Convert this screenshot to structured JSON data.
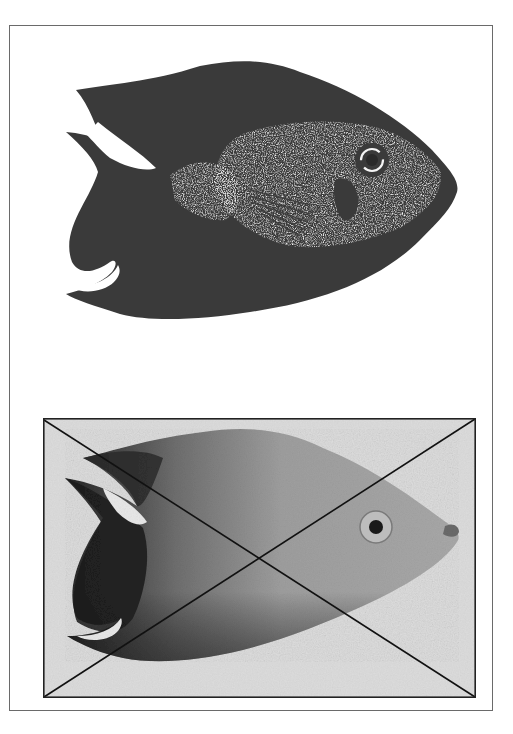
{
  "page": {
    "width": 513,
    "height": 734,
    "background": "#ffffff"
  },
  "frame": {
    "border_color": "#6a6a6a"
  },
  "figures": [
    {
      "id": "top",
      "description": "High-contrast black-and-white drawing of a fish facing right (dark silhouette with speckled white face and pectoral fin area)",
      "style": "halftone-silhouette",
      "fill_color": "#3a3a3a",
      "highlight_color": "#f4f4f4"
    },
    {
      "id": "bottom",
      "description": "Grayscale photograph of the same fish facing right, crossed out with a large X",
      "style": "grayscale-photo",
      "crossed_out": true,
      "box_border_color": "#222222",
      "background_color": "#dcdcdc",
      "body_color": "#9a9a9a",
      "dark_fin_color": "#1e1e1e"
    }
  ]
}
